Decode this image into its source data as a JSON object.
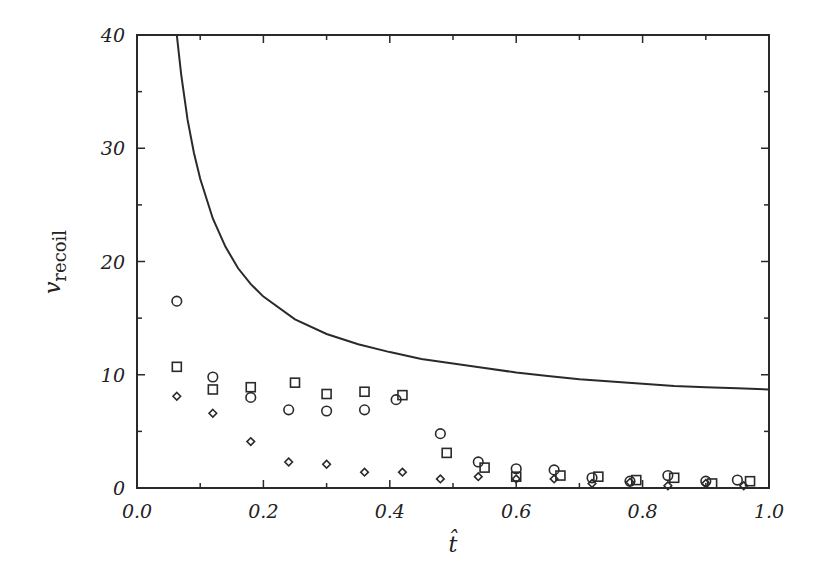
{
  "chart_data": {
    "type": "scatter",
    "title": "",
    "xlabel": "t̂",
    "ylabel": "v_recoil",
    "ylabel_main": "v",
    "ylabel_sub": "recoil",
    "xlim": [
      0.0,
      1.0
    ],
    "ylim": [
      0,
      40
    ],
    "grid": false,
    "legend": null,
    "x_ticks": [
      "0.0",
      "0.2",
      "0.4",
      "0.6",
      "0.8",
      "1.0"
    ],
    "y_ticks": [
      "0",
      "10",
      "20",
      "30",
      "40"
    ],
    "series": [
      {
        "name": "curve",
        "kind": "line",
        "x": [
          0.063,
          0.07,
          0.08,
          0.09,
          0.1,
          0.12,
          0.14,
          0.16,
          0.18,
          0.2,
          0.25,
          0.3,
          0.35,
          0.4,
          0.45,
          0.5,
          0.55,
          0.6,
          0.65,
          0.7,
          0.75,
          0.8,
          0.85,
          0.9,
          0.95,
          1.0
        ],
        "y": [
          40.0,
          36.5,
          32.5,
          29.6,
          27.3,
          23.8,
          21.3,
          19.4,
          18.0,
          16.9,
          14.9,
          13.6,
          12.7,
          12.0,
          11.4,
          11.0,
          10.6,
          10.2,
          9.9,
          9.6,
          9.4,
          9.2,
          9.0,
          8.9,
          8.8,
          8.7
        ]
      },
      {
        "name": "circles",
        "kind": "marker",
        "marker": "circle",
        "x": [
          0.063,
          0.12,
          0.18,
          0.24,
          0.3,
          0.36,
          0.41,
          0.48,
          0.54,
          0.6,
          0.66,
          0.72,
          0.78,
          0.84,
          0.9,
          0.95
        ],
        "y": [
          16.5,
          9.8,
          8.0,
          6.9,
          6.8,
          6.9,
          7.8,
          4.8,
          2.3,
          1.7,
          1.6,
          0.9,
          0.6,
          1.1,
          0.6,
          0.7
        ]
      },
      {
        "name": "squares",
        "kind": "marker",
        "marker": "square",
        "x": [
          0.063,
          0.12,
          0.18,
          0.25,
          0.3,
          0.36,
          0.42,
          0.49,
          0.55,
          0.6,
          0.67,
          0.73,
          0.79,
          0.85,
          0.91,
          0.97
        ],
        "y": [
          10.7,
          8.7,
          8.9,
          9.3,
          8.3,
          8.5,
          8.2,
          3.1,
          1.8,
          1.0,
          1.1,
          1.0,
          0.7,
          0.9,
          0.4,
          0.6
        ]
      },
      {
        "name": "diamonds",
        "kind": "marker",
        "marker": "diamond",
        "x": [
          0.063,
          0.12,
          0.18,
          0.24,
          0.3,
          0.36,
          0.42,
          0.48,
          0.54,
          0.6,
          0.66,
          0.72,
          0.78,
          0.84,
          0.9,
          0.96
        ],
        "y": [
          8.1,
          6.6,
          4.1,
          2.3,
          2.1,
          1.4,
          1.4,
          0.8,
          1.0,
          0.8,
          0.8,
          0.4,
          0.5,
          0.2,
          0.4,
          0.2
        ]
      }
    ]
  },
  "style": {
    "ink": "#2a2a2a",
    "background": "#ffffff"
  }
}
